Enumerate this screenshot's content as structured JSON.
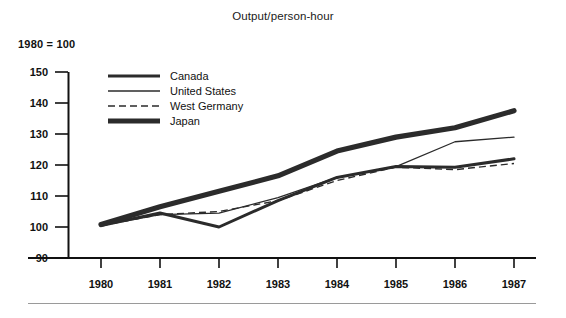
{
  "chart_data": {
    "type": "line",
    "title": "Output/person-hour",
    "subtitle": "1980 = 100",
    "xlabel": "",
    "ylabel": "",
    "categories": [
      "1980",
      "1981",
      "1982",
      "1983",
      "1984",
      "1985",
      "1986",
      "1987"
    ],
    "x": [
      1980,
      1981,
      1982,
      1983,
      1984,
      1985,
      1986,
      1987
    ],
    "xlim": [
      1980,
      1987
    ],
    "ylim": [
      90,
      150
    ],
    "yticks": [
      90,
      100,
      110,
      120,
      130,
      140,
      150
    ],
    "ytick_labels": [
      "90",
      "100",
      "110",
      "120",
      "130",
      "140",
      "150"
    ],
    "grid": false,
    "legend_position": "upper-left-inside",
    "series": [
      {
        "name": "Canada",
        "style": "solid",
        "width": "medium",
        "color": "#2b2b2b",
        "values": [
          100.5,
          104.5,
          100.0,
          108.5,
          116.0,
          119.5,
          119.3,
          122.0
        ]
      },
      {
        "name": "United States",
        "style": "solid",
        "width": "thin",
        "color": "#2b2b2b",
        "values": [
          100.5,
          104.0,
          104.5,
          109.5,
          116.0,
          119.5,
          127.5,
          129.0
        ]
      },
      {
        "name": "West Germany",
        "style": "dashed",
        "width": "thin",
        "color": "#2b2b2b",
        "values": [
          100.5,
          104.0,
          105.0,
          108.5,
          115.0,
          119.3,
          118.5,
          120.5
        ]
      },
      {
        "name": "Japan",
        "style": "solid",
        "width": "thick",
        "color": "#2b2b2b",
        "values": [
          100.8,
          106.5,
          111.5,
          116.5,
          124.5,
          129.0,
          132.0,
          137.5
        ]
      }
    ]
  },
  "legend": {
    "items": [
      {
        "label": "Canada",
        "swatch": "line-swatch-medium-solid"
      },
      {
        "label": "United States",
        "swatch": "line-swatch-thin-solid"
      },
      {
        "label": "West Germany",
        "swatch": "line-swatch-thin-dashed"
      },
      {
        "label": "Japan",
        "swatch": "line-swatch-thick-solid"
      }
    ]
  },
  "axes": {
    "y_tick_labels": [
      "150",
      "140",
      "130",
      "120",
      "110",
      "100",
      "90"
    ],
    "x_tick_labels": [
      "1980",
      "1981",
      "1982",
      "1983",
      "1984",
      "1985",
      "1986",
      "1987"
    ]
  }
}
